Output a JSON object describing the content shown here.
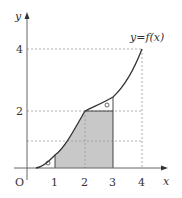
{
  "diagram": {
    "type": "function-graph-area",
    "function_label": "y=f(x)",
    "axes": {
      "x_label": "x",
      "y_label": "y",
      "origin_label": "O",
      "x_ticks": [
        "1",
        "2",
        "3",
        "4"
      ],
      "y_ticks": [
        "2",
        "4"
      ]
    },
    "colors": {
      "shade": "#c8c8c8",
      "curve": "#333333",
      "axis": "#555555",
      "dashed": "#888888"
    },
    "markers": {
      "lower_region": "○",
      "upper_region": "○"
    },
    "points": [
      {
        "x": 0,
        "y": 0
      },
      {
        "x": 1,
        "y": 0.5
      },
      {
        "x": 2,
        "y": 2
      },
      {
        "x": 3,
        "y": 2.5
      },
      {
        "x": 4,
        "y": 4
      }
    ],
    "shaded_region": {
      "x_from": 1,
      "x_to": 3,
      "y_cap": 2
    }
  }
}
